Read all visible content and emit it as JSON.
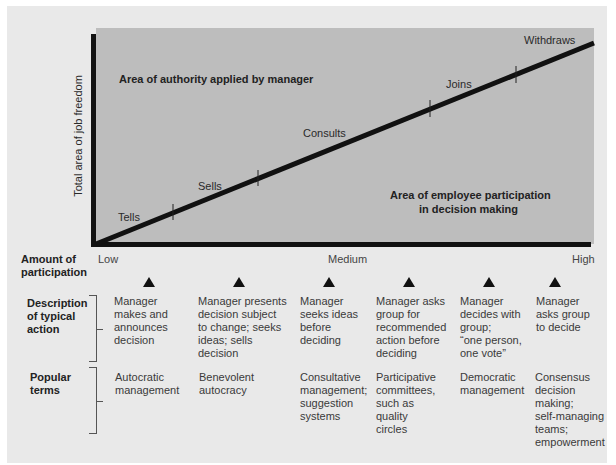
{
  "diagram": {
    "y_axis_label": "Total area of job freedom",
    "regions": {
      "manager_area": "Area of authority applied by manager",
      "employee_area_line1": "Area of employee participation",
      "employee_area_line2": "in decision making"
    },
    "line_labels": [
      "Tells",
      "Sells",
      "Consults",
      "Joins",
      "Withdraws"
    ],
    "participation": {
      "label": "Amount of\nparticipation",
      "low": "Low",
      "medium": "Medium",
      "high": "High"
    },
    "rows": {
      "description_label": "Description\nof typical\naction",
      "popular_label": "Popular\nterms"
    },
    "columns": [
      {
        "description": "Manager\nmakes and\nannounces\ndecision",
        "popular": "Autocratic\nmanagement"
      },
      {
        "description": "Manager presents\ndecision subject\nto change; seeks\nideas; sells\ndecision",
        "popular": "Benevolent\nautocracy"
      },
      {
        "description": "Manager\nseeks ideas\nbefore\ndeciding",
        "popular": "Consultative\nmanagement;\nsuggestion\nsystems"
      },
      {
        "description": "Manager asks\ngroup for\nrecommended\naction before\ndeciding",
        "popular": "Participative\ncommittees,\nsuch as\nquality\ncircles"
      },
      {
        "description": "Manager\ndecides with\ngroup;\n“one person,\none vote”",
        "popular": "Democratic\nmanagement"
      },
      {
        "description": "Manager\nasks group\nto decide",
        "popular": "Consensus\ndecision\nmaking;\nself-managing\nteams;\nempowerment"
      }
    ],
    "colors": {
      "panel_bg": "#e9e9e9",
      "chart_area": "#bdbdbd",
      "axis_line": "#111111"
    }
  }
}
